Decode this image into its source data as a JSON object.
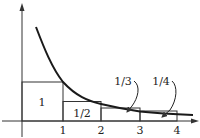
{
  "diagram": {
    "title": "",
    "function": "y = 1/x",
    "x_ticks": [
      {
        "value": 1,
        "label": "1"
      },
      {
        "value": 2,
        "label": "2"
      },
      {
        "value": 3,
        "label": "3"
      },
      {
        "value": 4,
        "label": "4"
      }
    ],
    "rectangles": [
      {
        "from": 0,
        "to": 1,
        "height": 1,
        "label": "1"
      },
      {
        "from": 1,
        "to": 2,
        "height": 0.5,
        "label": "1/2"
      },
      {
        "from": 2,
        "to": 3,
        "height": 0.3333,
        "label": "1/3"
      },
      {
        "from": 3,
        "to": 4,
        "height": 0.25,
        "label": "1/4"
      }
    ],
    "callouts": [
      {
        "label": "1/3",
        "points_to": "rectangle 2-3"
      },
      {
        "label": "1/4",
        "points_to": "rectangle 3-4"
      }
    ],
    "colors": {
      "curve": "#1a1a1a",
      "lines": "#333333",
      "background": "#ffffff"
    }
  }
}
